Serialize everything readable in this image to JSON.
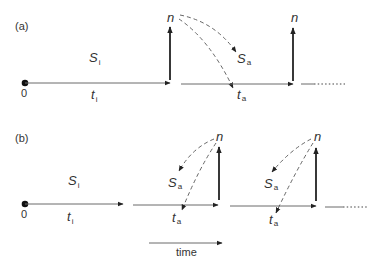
{
  "diagram": {
    "panels": [
      {
        "id": "a",
        "label": "(a)",
        "origin_label": "0",
        "state_initial": {
          "symbol": "S",
          "subscript": "i"
        },
        "time_initial": {
          "symbol": "t",
          "subscript": "i"
        },
        "pulse_label": "n",
        "state_after": {
          "symbol": "S",
          "subscript": "a"
        },
        "time_after": {
          "symbol": "t",
          "subscript": "a"
        },
        "pulse2_label": "n"
      },
      {
        "id": "b",
        "label": "(b)",
        "origin_label": "0",
        "state_initial": {
          "symbol": "S",
          "subscript": "i"
        },
        "time_initial": {
          "symbol": "t",
          "subscript": "i"
        },
        "pulse_label": "n",
        "state_after": {
          "symbol": "S",
          "subscript": "a"
        },
        "time_after": {
          "symbol": "t",
          "subscript": "a"
        },
        "pulse2_label": "n",
        "state_after2": {
          "symbol": "S",
          "subscript": "a"
        },
        "time_after2": {
          "symbol": "t",
          "subscript": "a"
        }
      }
    ],
    "time_axis_label": "time",
    "colors": {
      "line": "#6a6a6a",
      "pulse": "#222222",
      "text": "#333333"
    }
  }
}
